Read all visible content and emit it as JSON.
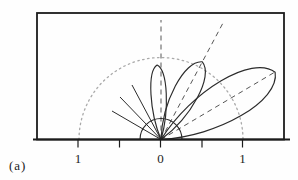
{
  "figure": {
    "type": "antenna-lobe-pattern-diagram",
    "caption": "(a)",
    "canvas": {
      "width": 298,
      "height": 180,
      "background": "#fefefe"
    },
    "colors": {
      "frame": "#1c1c1c",
      "solid": "#2b2b2b",
      "dashed": "#565656",
      "dotted": "#a9a9a9",
      "text": "#1c1c1c"
    },
    "frame": {
      "x": 37,
      "y": 13,
      "width": 247,
      "height": 126.5
    },
    "axis": {
      "y": 139.5,
      "x1": 33,
      "x2": 290,
      "tick_length": 8,
      "label_baseline_y": 163,
      "ticks": [
        {
          "x": 78,
          "label": "1"
        },
        {
          "x": 119.5,
          "label": ""
        },
        {
          "x": 160.5,
          "label": "0"
        },
        {
          "x": 202,
          "label": ""
        },
        {
          "x": 242.5,
          "label": "1"
        }
      ]
    },
    "origin": {
      "x": 161,
      "y": 139.5
    },
    "unit_circle": {
      "r": 82,
      "style": "dotted"
    },
    "inner_semicircle": {
      "r": 21
    },
    "lobes": [
      {
        "name": "lobe-vertical",
        "tilt_deg": -3,
        "length": 74.5,
        "half_width": 8
      },
      {
        "name": "lobe-middle",
        "tilt_deg": 28,
        "length": 88,
        "half_width": 13
      },
      {
        "name": "lobe-main",
        "tilt_deg": 59.5,
        "length": 132.5,
        "half_width": 21
      }
    ],
    "dashed_axes": [
      {
        "name": "vertical-axis-line",
        "x2": 161,
        "y2": 20
      },
      {
        "name": "middle-lobe-axis-line",
        "x2": 223,
        "y2": 23
      },
      {
        "name": "main-lobe-axis-line",
        "x2": 275,
        "y2": 72
      }
    ],
    "rays": [
      {
        "name": "origin-ray-left-1",
        "x2": 112,
        "y2": 111
      },
      {
        "name": "origin-ray-left-2",
        "x2": 120,
        "y2": 97
      },
      {
        "name": "origin-ray-left-3",
        "x2": 132,
        "y2": 85
      }
    ]
  }
}
